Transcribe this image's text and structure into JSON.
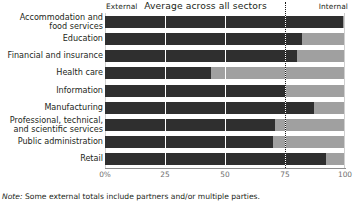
{
  "header": {
    "left_label": "External",
    "center_label": "Average across all sectors",
    "right_label": "Internal"
  },
  "note": {
    "lead": "Note:",
    "text": " Some external totals include partners and/or multiple parties."
  },
  "colors": {
    "external_bar": "#2f2f2f",
    "internal_bar": "#a0a0a0",
    "average_line": "#1a1a1a",
    "axis": "#8d8d8d",
    "text": "#231f20",
    "tick_text": "#6f6f6f"
  },
  "chart_data": {
    "type": "bar",
    "orientation": "horizontal",
    "stacked": true,
    "title": "Average across all sectors",
    "xlabel": "",
    "ylabel": "",
    "xlim": [
      0,
      100
    ],
    "xticks": [
      0,
      25,
      50,
      75,
      100
    ],
    "xtick_labels": [
      "0%",
      "25",
      "50",
      "75",
      "100"
    ],
    "grid": true,
    "legend_position": "top",
    "annotations": [
      {
        "label": "External",
        "position": "top-left"
      },
      {
        "label": "Internal",
        "position": "top-right"
      },
      {
        "label": "Average across all sectors",
        "position": "top-center",
        "value": 75
      }
    ],
    "average_line_value": 75,
    "categories": [
      "Accommodation and\nfood services",
      "Education",
      "Financial and insurance",
      "Health care",
      "Information",
      "Manufacturing",
      "Professional, technical,\nand scientific services",
      "Public administration",
      "Retail"
    ],
    "series": [
      {
        "name": "External",
        "color": "#2f2f2f",
        "values": [
          99,
          82,
          80,
          44,
          75,
          87,
          71,
          70,
          92
        ]
      },
      {
        "name": "Internal",
        "color": "#a0a0a0",
        "values": [
          1,
          18,
          20,
          56,
          25,
          13,
          29,
          30,
          8
        ]
      }
    ]
  }
}
